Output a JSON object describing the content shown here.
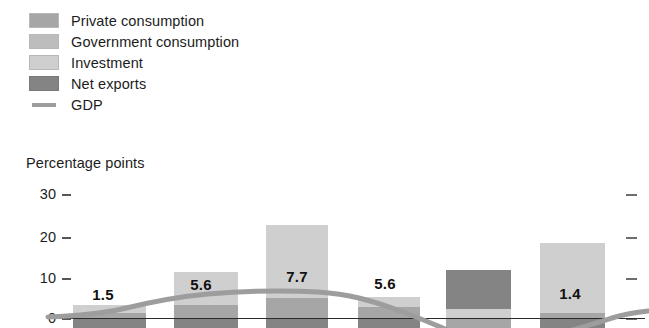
{
  "legend": {
    "items": [
      {
        "label": "Private consumption",
        "color": "#a6a6a6",
        "type": "swatch",
        "icon": "square-swatch-icon"
      },
      {
        "label": "Government consumption",
        "color": "#bdbdbd",
        "type": "swatch",
        "icon": "square-swatch-icon"
      },
      {
        "label": "Investment",
        "color": "#cfcfcf",
        "type": "swatch",
        "icon": "square-swatch-icon"
      },
      {
        "label": "Net exports",
        "color": "#848484",
        "type": "swatch",
        "icon": "square-swatch-icon"
      },
      {
        "label": "GDP",
        "color": "#9d9d9d",
        "type": "line",
        "icon": "line-swatch-icon"
      }
    ]
  },
  "axis": {
    "y_title": "Percentage points",
    "ticks": [
      "30",
      "20",
      "10",
      "0"
    ]
  },
  "chart_data": {
    "type": "bar",
    "title": "",
    "subtitle": "",
    "xlabel": "",
    "ylabel": "Percentage points",
    "ylim": [
      -10,
      32
    ],
    "yticks": [
      0,
      10,
      20,
      30
    ],
    "grid": false,
    "legend_position": "top-left",
    "stacked": true,
    "categories": [
      "1",
      "2",
      "3",
      "4",
      "5",
      "6"
    ],
    "series": [
      {
        "name": "Private consumption",
        "color": "#a6a6a6",
        "values": [
          1.8,
          4.0,
          5.0,
          3.2,
          1.2,
          1.0
        ]
      },
      {
        "name": "Government consumption",
        "color": "#bdbdbd",
        "values": [
          0.6,
          1.0,
          1.3,
          0.8,
          0.7,
          0.6
        ]
      },
      {
        "name": "Investment",
        "color": "#cfcfcf",
        "values": [
          1.2,
          3.8,
          15.5,
          1.0,
          0.6,
          16.5
        ]
      },
      {
        "name": "Net exports",
        "color": "#848484",
        "values": [
          -2.1,
          -3.2,
          -14.1,
          0.6,
          8.6,
          -17.7
        ]
      }
    ],
    "line_series": {
      "name": "GDP",
      "color": "#9d9d9d",
      "values": [
        1.5,
        5.6,
        7.7,
        5.6,
        -4.0,
        1.4
      ]
    },
    "data_labels": [
      "1.5",
      "5.6",
      "7.7",
      "5.6",
      "",
      "1.4"
    ]
  },
  "bars": [
    {
      "value_label": "1.5",
      "label_x": 86,
      "label_y": 286,
      "x": 73,
      "w": 73,
      "segments": [
        {
          "name": "Investment",
          "color": "#cfcfcf",
          "top": 305,
          "height": 13
        },
        {
          "name": "Private consumption",
          "color": "#a6a6a6",
          "top": 313,
          "height": 6
        },
        {
          "name": "Net exports",
          "color": "#848484",
          "top": 318,
          "height": 10
        }
      ]
    },
    {
      "value_label": "5.6",
      "label_x": 184,
      "label_y": 276,
      "x": 174,
      "w": 64,
      "segments": [
        {
          "name": "Investment",
          "color": "#cfcfcf",
          "top": 272,
          "height": 33
        },
        {
          "name": "Private consumption",
          "color": "#a6a6a6",
          "top": 305,
          "height": 13
        },
        {
          "name": "Net exports",
          "color": "#848484",
          "top": 318,
          "height": 10
        }
      ]
    },
    {
      "value_label": "7.7",
      "label_x": 280,
      "label_y": 268,
      "x": 266,
      "w": 62,
      "segments": [
        {
          "name": "Investment",
          "color": "#cfcfcf",
          "top": 225,
          "height": 73
        },
        {
          "name": "Private consumption",
          "color": "#a6a6a6",
          "top": 298,
          "height": 20
        },
        {
          "name": "Net exports",
          "color": "#848484",
          "top": 318,
          "height": 10
        }
      ]
    },
    {
      "value_label": "5.6",
      "label_x": 368,
      "label_y": 275,
      "x": 358,
      "w": 62,
      "segments": [
        {
          "name": "Investment",
          "color": "#cfcfcf",
          "top": 297,
          "height": 10
        },
        {
          "name": "Private consumption",
          "color": "#a6a6a6",
          "top": 307,
          "height": 11
        },
        {
          "name": "Net exports",
          "color": "#848484",
          "top": 318,
          "height": 10
        }
      ]
    },
    {
      "value_label": "",
      "label_x": 455,
      "label_y": 280,
      "x": 446,
      "w": 65,
      "segments": [
        {
          "name": "Net exports",
          "color": "#848484",
          "top": 270,
          "height": 39
        },
        {
          "name": "Investment",
          "color": "#cfcfcf",
          "top": 309,
          "height": 9
        },
        {
          "name": "Private consumption",
          "color": "#a6a6a6",
          "top": 318,
          "height": 10
        }
      ]
    },
    {
      "value_label": "1.4",
      "label_x": 553,
      "label_y": 285,
      "x": 540,
      "w": 65,
      "segments": [
        {
          "name": "Investment",
          "color": "#cfcfcf",
          "top": 243,
          "height": 70
        },
        {
          "name": "Private consumption",
          "color": "#a6a6a6",
          "top": 313,
          "height": 5
        },
        {
          "name": "Net exports",
          "color": "#848484",
          "top": 318,
          "height": 10
        }
      ]
    }
  ],
  "geometry": {
    "zero_y": 318,
    "tick_ys": [
      194,
      237,
      278,
      318
    ],
    "left_tick_x": 62,
    "right_tick_x": 626,
    "zero_line_x0": 48,
    "zero_line_x1": 645
  }
}
